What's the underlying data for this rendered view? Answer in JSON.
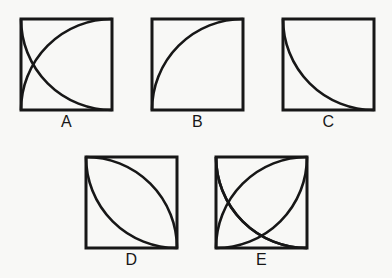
{
  "sheet": {
    "title": "Geometric arc figures A through E",
    "background_color": "#f8f8f6",
    "ink_color": "#171717",
    "width": 392,
    "height": 278
  },
  "panels": [
    {
      "id": "A",
      "label": "A",
      "x": 21,
      "y": 19,
      "size": 91,
      "label_y": 114,
      "description": "Square with two crossing quarter-circle arcs",
      "arc_count": 2,
      "arcs": [
        {
          "name": "arc-from-top-left-center",
          "center_corner": "top-left",
          "from": "bottom-left",
          "to": "top-right",
          "sweep": "clockwise"
        },
        {
          "name": "arc-from-bottom-left-center",
          "center_corner": "bottom-left",
          "from": "top-left",
          "to": "bottom-right",
          "sweep": "counter-clockwise"
        }
      ]
    },
    {
      "id": "B",
      "label": "B",
      "x": 152,
      "y": 19,
      "size": 91,
      "label_y": 114,
      "description": "Square with one quarter-circle arc centered at top-left corner",
      "arc_count": 1,
      "arcs": [
        {
          "name": "arc-from-top-left-center",
          "center_corner": "top-left",
          "from": "bottom-left",
          "to": "top-right",
          "sweep": "clockwise"
        }
      ]
    },
    {
      "id": "C",
      "label": "C",
      "x": 283,
      "y": 19,
      "size": 91,
      "label_y": 114,
      "description": "Square with one quarter-circle arc centered at top-right corner",
      "arc_count": 1,
      "arcs": [
        {
          "name": "arc-from-top-right-center",
          "center_corner": "top-right",
          "from": "top-left",
          "to": "bottom-right",
          "sweep": "counter-clockwise"
        }
      ]
    },
    {
      "id": "D",
      "label": "D",
      "x": 86,
      "y": 157,
      "size": 91,
      "label_y": 252,
      "description": "Square with two quarter-circle arcs forming a lens (vesica) between top-left and bottom-right corners",
      "arc_count": 2,
      "arcs": [
        {
          "name": "arc-from-bottom-left-center",
          "center_corner": "bottom-left",
          "from": "top-left",
          "to": "bottom-right",
          "sweep": "clockwise"
        },
        {
          "name": "arc-from-top-right-center",
          "center_corner": "top-right",
          "from": "top-left",
          "to": "bottom-right",
          "sweep": "counter-clockwise"
        }
      ]
    },
    {
      "id": "E",
      "label": "E",
      "x": 216,
      "y": 157,
      "size": 91,
      "label_y": 252,
      "description": "Square with four quarter-circle arcs, one centered at each corner, forming a four-petal rosette",
      "arc_count": 4,
      "arcs": [
        {
          "name": "arc-from-top-left-center",
          "center_corner": "top-left",
          "from": "bottom-left",
          "to": "top-right",
          "sweep": "clockwise"
        },
        {
          "name": "arc-from-top-right-center",
          "center_corner": "top-right",
          "from": "top-left",
          "to": "bottom-right",
          "sweep": "counter-clockwise"
        },
        {
          "name": "arc-from-bottom-right-center",
          "center_corner": "bottom-right",
          "from": "top-right",
          "to": "bottom-left",
          "sweep": "clockwise"
        },
        {
          "name": "arc-from-bottom-left-center",
          "center_corner": "bottom-left",
          "from": "bottom-right",
          "to": "top-left",
          "sweep": "clockwise"
        }
      ]
    }
  ]
}
